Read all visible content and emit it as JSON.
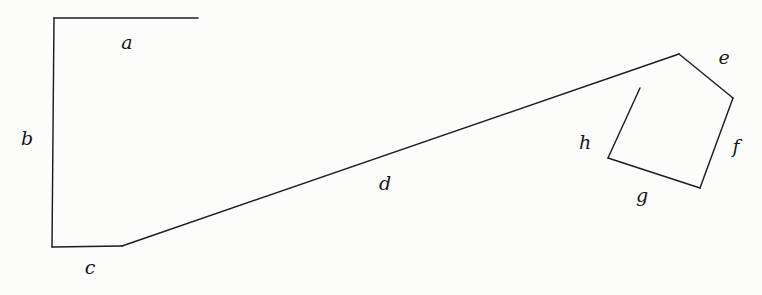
{
  "figure": {
    "background_color": "#fcfcfa",
    "stroke_color": "#1c1c22",
    "label_color": "#15151b",
    "width": 762,
    "height": 295
  },
  "chart_data": {
    "type": "line",
    "xlabel": "",
    "ylabel": "",
    "xlim": [
      0,
      762
    ],
    "ylim": [
      295,
      0
    ],
    "grid": false,
    "legend": "none",
    "coordinate_note": "Pixel coordinates, origin at top-left of the 762x295 canvas.",
    "vertices": {
      "a_start": [
        54,
        18
      ],
      "a_end": [
        198,
        18
      ],
      "b_start": [
        54,
        18
      ],
      "b_end": [
        52,
        247
      ],
      "c_start": [
        52,
        247
      ],
      "c_end": [
        122,
        246
      ],
      "d_start": [
        122,
        246
      ],
      "d_end": [
        679,
        54
      ],
      "e_start": [
        679,
        54
      ],
      "e_end": [
        733,
        98
      ],
      "f_start": [
        733,
        98
      ],
      "f_end": [
        700,
        188
      ],
      "g_start": [
        700,
        188
      ],
      "g_end": [
        608,
        158
      ],
      "h_start": [
        608,
        158
      ],
      "h_end": [
        640,
        88
      ]
    },
    "polylines": [
      {
        "name": "upper-left-open-polyline",
        "points": [
          [
            198,
            18
          ],
          [
            54,
            18
          ],
          [
            52,
            247
          ],
          [
            122,
            246
          ],
          [
            679,
            54
          ],
          [
            733,
            98
          ],
          [
            700,
            188
          ],
          [
            608,
            158
          ],
          [
            640,
            88
          ]
        ],
        "closed": false
      }
    ],
    "segments": [
      {
        "label": "a",
        "from": [
          54,
          18
        ],
        "to": [
          198,
          18
        ],
        "orientation": "horizontal",
        "label_pos": [
          127,
          42
        ]
      },
      {
        "label": "b",
        "from": [
          54,
          18
        ],
        "to": [
          52,
          247
        ],
        "orientation": "vertical",
        "label_pos": [
          27,
          138
        ]
      },
      {
        "label": "c",
        "from": [
          52,
          247
        ],
        "to": [
          122,
          246
        ],
        "orientation": "horizontal",
        "label_pos": [
          90,
          267
        ]
      },
      {
        "label": "d",
        "from": [
          122,
          246
        ],
        "to": [
          679,
          54
        ],
        "orientation": "diagonal-up-right",
        "label_pos": [
          385,
          183
        ]
      },
      {
        "label": "e",
        "from": [
          679,
          54
        ],
        "to": [
          733,
          98
        ],
        "orientation": "diagonal-down-right",
        "label_pos": [
          724,
          57
        ]
      },
      {
        "label": "f",
        "from": [
          733,
          98
        ],
        "to": [
          700,
          188
        ],
        "orientation": "diagonal-down-left",
        "label_pos": [
          736,
          146
        ]
      },
      {
        "label": "g",
        "from": [
          700,
          188
        ],
        "to": [
          608,
          158
        ],
        "orientation": "diagonal-up-left",
        "label_pos": [
          642,
          195
        ]
      },
      {
        "label": "h",
        "from": [
          608,
          158
        ],
        "to": [
          640,
          88
        ],
        "orientation": "diagonal-up-right",
        "label_pos": [
          585,
          142
        ]
      }
    ],
    "labels": [
      "a",
      "b",
      "c",
      "d",
      "e",
      "f",
      "g",
      "h"
    ]
  }
}
